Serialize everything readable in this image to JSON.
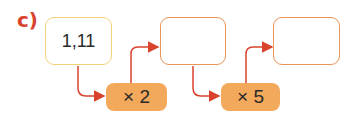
{
  "exercise": {
    "label": "c)",
    "start_value": "1,11",
    "intermediate_value": "",
    "result_value": "",
    "operations": [
      {
        "label": "× 2"
      },
      {
        "label": "× 5"
      }
    ]
  },
  "colors": {
    "label": "#d9432e",
    "arrow": "#d9432e",
    "start_box_border": "#f3d27a",
    "answer_box_border": "#e8955a",
    "operation_fill": "#f2a95b"
  }
}
